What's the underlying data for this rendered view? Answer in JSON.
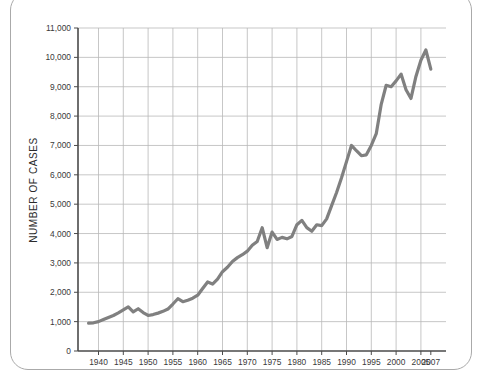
{
  "figure": {
    "frame_color": "#aaaaaa",
    "background": "#ffffff"
  },
  "chart_data": {
    "type": "line",
    "title": "",
    "subtitle": "",
    "xlabel": "",
    "ylabel": "NUMBER OF CASES",
    "xlim": [
      1938,
      2007
    ],
    "ylim": [
      0,
      11000
    ],
    "grid": true,
    "grid_color": "#b9b9b9",
    "legend": null,
    "legend_position": "none",
    "line_color": "#808080",
    "line_width": 3.2,
    "y_ticks": [
      0,
      1000,
      2000,
      3000,
      4000,
      5000,
      6000,
      7000,
      8000,
      9000,
      10000,
      11000
    ],
    "y_tick_labels": [
      "0",
      "1,000",
      "2,000",
      "3,000",
      "4,000",
      "5,000",
      "6,000",
      "7,000",
      "8,000",
      "9,000",
      "10,000",
      "11,000"
    ],
    "x_ticks": [
      1940,
      1945,
      1950,
      1955,
      1960,
      1965,
      1970,
      1975,
      1980,
      1985,
      1990,
      1995,
      2000,
      2005,
      2007
    ],
    "x_tick_labels": [
      "1940",
      "1945",
      "1950",
      "1955",
      "1960",
      "1965",
      "1970",
      "1975",
      "1980",
      "1985",
      "1990",
      "1995",
      "2000",
      "2005",
      "2007"
    ],
    "x_gridlines": [
      1940,
      1945,
      1950,
      1955,
      1960,
      1965,
      1970,
      1975,
      1980,
      1985,
      1990,
      1995,
      2000,
      2005
    ],
    "series": [
      {
        "name": "Number of cases",
        "x": [
          1938,
          1939,
          1940,
          1941,
          1942,
          1943,
          1944,
          1945,
          1946,
          1947,
          1948,
          1949,
          1950,
          1951,
          1952,
          1953,
          1954,
          1955,
          1956,
          1957,
          1958,
          1959,
          1960,
          1961,
          1962,
          1963,
          1964,
          1965,
          1966,
          1967,
          1968,
          1969,
          1970,
          1971,
          1972,
          1973,
          1974,
          1975,
          1976,
          1977,
          1978,
          1979,
          1980,
          1981,
          1982,
          1983,
          1984,
          1985,
          1986,
          1987,
          1988,
          1989,
          1990,
          1991,
          1992,
          1993,
          1994,
          1995,
          1996,
          1997,
          1998,
          1999,
          2000,
          2001,
          2002,
          2003,
          2004,
          2005,
          2006,
          2007
        ],
        "y": [
          950,
          960,
          1000,
          1070,
          1140,
          1210,
          1300,
          1400,
          1500,
          1330,
          1440,
          1310,
          1210,
          1240,
          1290,
          1350,
          1430,
          1600,
          1780,
          1680,
          1730,
          1800,
          1900,
          2130,
          2350,
          2280,
          2450,
          2700,
          2850,
          3050,
          3180,
          3280,
          3400,
          3600,
          3730,
          4200,
          3520,
          4050,
          3800,
          3870,
          3820,
          3900,
          4300,
          4450,
          4200,
          4080,
          4300,
          4270,
          4500,
          4950,
          5400,
          5900,
          6450,
          7000,
          6820,
          6650,
          6680,
          7000,
          7400,
          8400,
          9050,
          9000,
          9200,
          9430,
          8900,
          8600,
          9350,
          9900,
          10250,
          9600
        ]
      }
    ]
  }
}
